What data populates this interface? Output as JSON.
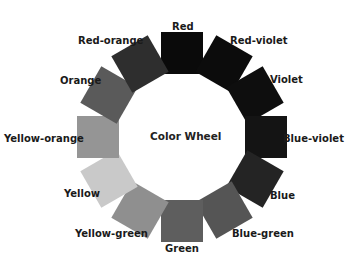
{
  "title": "Color Wheel",
  "wheel": {
    "center": [
      182,
      137
    ],
    "radius": 84,
    "square_size": 42,
    "segments": [
      {
        "name": "Red",
        "color": "#0a0a0a",
        "angle": 0,
        "label_pos": [
          172,
          21
        ]
      },
      {
        "name": "Red-violet",
        "color": "#0c0c0c",
        "angle": 30,
        "label_pos": [
          230,
          35
        ]
      },
      {
        "name": "Violet",
        "color": "#0e0e0e",
        "angle": 60,
        "label_pos": [
          270,
          74
        ]
      },
      {
        "name": "Blue-violet",
        "color": "#141414",
        "angle": 90,
        "label_pos": [
          283,
          133
        ]
      },
      {
        "name": "Blue",
        "color": "#242424",
        "angle": 120,
        "label_pos": [
          270,
          190
        ]
      },
      {
        "name": "Blue-green",
        "color": "#555555",
        "angle": 150,
        "label_pos": [
          232,
          228
        ]
      },
      {
        "name": "Green",
        "color": "#5e5e5e",
        "angle": 180,
        "label_pos": [
          165,
          243
        ]
      },
      {
        "name": "Yellow-green",
        "color": "#8f8f8f",
        "angle": 210,
        "label_pos": [
          75,
          228
        ]
      },
      {
        "name": "Yellow",
        "color": "#c9c9c9",
        "angle": 240,
        "label_pos": [
          64,
          188
        ]
      },
      {
        "name": "Yellow-orange",
        "color": "#959595",
        "angle": 270,
        "label_pos": [
          4,
          133
        ]
      },
      {
        "name": "Orange",
        "color": "#5a5a5a",
        "angle": 300,
        "label_pos": [
          60,
          75
        ]
      },
      {
        "name": "Red-orange",
        "color": "#2e2e2e",
        "angle": 330,
        "label_pos": [
          78,
          35
        ]
      }
    ]
  }
}
